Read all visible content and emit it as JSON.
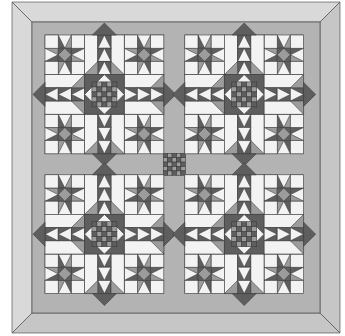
{
  "illustration": {
    "title": "Quilt pattern illustration",
    "subject": "Four star blocks with sashing, nine-patch cornerstones, and mitered border",
    "layout": {
      "blocks_across": 2,
      "blocks_down": 2,
      "block_grid": 9
    }
  },
  "colors": {
    "background": "#ffffff",
    "border_outer": "#d9d9d9",
    "border_shade": "#c6c6c6",
    "sashing": "#b3b3b3",
    "dark": "#5e5e5e",
    "medium": "#9c9c9c",
    "light": "#f3f3f3",
    "line": "#3c3c3c"
  }
}
